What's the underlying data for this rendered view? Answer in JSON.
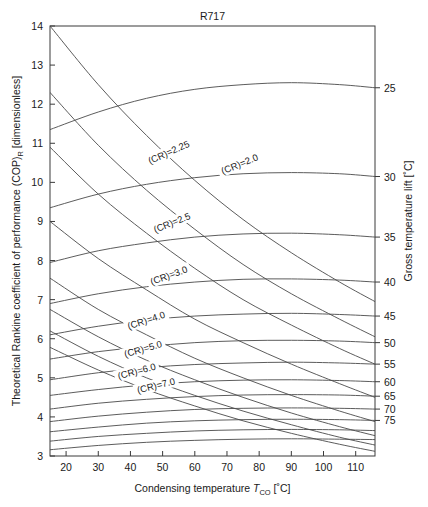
{
  "chart_data": {
    "type": "line",
    "title": "R717",
    "xlabel": "Condensing temperature T_CO [°C]",
    "ylabel": "Theoretical Rankine coefficient of performance (COP)_R [dimensionless]",
    "y2label": "Gross temperature lift [°C]",
    "xlim": [
      15,
      116
    ],
    "ylim": [
      3,
      14
    ],
    "xticks": [
      20,
      30,
      40,
      50,
      60,
      70,
      80,
      90,
      100,
      110
    ],
    "yticks": [
      3,
      4,
      5,
      6,
      7,
      8,
      9,
      10,
      11,
      12,
      13,
      14
    ],
    "y2_ticks": [
      25,
      30,
      35,
      40,
      45,
      50,
      55,
      60,
      65,
      70,
      75
    ],
    "grid": false,
    "legend": "inline curve labels",
    "series": [
      {
        "name": "(CR)=2.0",
        "family": "compression-ratio",
        "label": "(CR)=2.0",
        "label_x": 74,
        "label_y": 10.45,
        "label_rot": -22,
        "x": [
          15,
          30,
          45,
          60,
          75,
          90,
          105,
          116
        ],
        "y": [
          14.0,
          12.5,
          11.2,
          10.05,
          9.05,
          8.2,
          7.45,
          6.95
        ]
      },
      {
        "name": "(CR)=2.25",
        "family": "compression-ratio",
        "label": "(CR)=2.25",
        "label_x": 52,
        "label_y": 10.75,
        "label_rot": -24,
        "x": [
          15,
          30,
          45,
          60,
          75,
          90,
          105,
          116
        ],
        "y": [
          12.3,
          10.95,
          9.8,
          8.8,
          7.9,
          7.15,
          6.5,
          6.05
        ]
      },
      {
        "name": "(CR)=2.5",
        "family": "compression-ratio",
        "label": "(CR)=2.5",
        "label_x": 53,
        "label_y": 8.95,
        "label_rot": -22,
        "x": [
          15,
          30,
          45,
          60,
          75,
          90,
          105,
          116
        ],
        "y": [
          10.9,
          9.7,
          8.7,
          7.8,
          7.0,
          6.35,
          5.75,
          5.35
        ]
      },
      {
        "name": "(CR)=3.0",
        "family": "compression-ratio",
        "label": "(CR)=3.0",
        "label_x": 52,
        "label_y": 7.6,
        "label_rot": -20,
        "x": [
          15,
          30,
          45,
          60,
          75,
          90,
          105,
          116
        ],
        "y": [
          9.0,
          8.05,
          7.25,
          6.5,
          5.9,
          5.35,
          4.85,
          4.5
        ]
      },
      {
        "name": "(CR)=4.0",
        "family": "compression-ratio",
        "label": "(CR)=4.0",
        "label_x": 45,
        "label_y": 6.45,
        "label_rot": -18,
        "x": [
          15,
          30,
          45,
          60,
          75,
          90,
          105,
          116
        ],
        "y": [
          7.55,
          6.75,
          6.1,
          5.5,
          5.0,
          4.55,
          4.15,
          3.88
        ]
      },
      {
        "name": "(CR)=5.0",
        "family": "compression-ratio",
        "label": "(CR)=5.0",
        "label_x": 44,
        "label_y": 5.72,
        "label_rot": -16,
        "x": [
          15,
          30,
          45,
          60,
          75,
          90,
          105,
          116
        ],
        "y": [
          6.75,
          6.05,
          5.45,
          4.95,
          4.5,
          4.1,
          3.75,
          3.52
        ]
      },
      {
        "name": "(CR)=6.0",
        "family": "compression-ratio",
        "label": "(CR)=6.0",
        "label_x": 42,
        "label_y": 5.15,
        "label_rot": -15,
        "x": [
          15,
          30,
          45,
          60,
          75,
          90,
          105,
          116
        ],
        "y": [
          6.2,
          5.55,
          5.0,
          4.55,
          4.15,
          3.8,
          3.48,
          3.28
        ]
      },
      {
        "name": "(CR)=7.0",
        "family": "compression-ratio",
        "label": "(CR)=7.0",
        "label_x": 48,
        "label_y": 4.78,
        "label_rot": -14,
        "x": [
          15,
          30,
          45,
          60,
          75,
          90,
          105,
          116
        ],
        "y": [
          5.78,
          5.2,
          4.7,
          4.28,
          3.9,
          3.58,
          3.3,
          3.12
        ]
      },
      {
        "name": "lift-25",
        "family": "gross-temperature-lift",
        "label": "25",
        "x": [
          15,
          30,
          45,
          60,
          75,
          90,
          105,
          116
        ],
        "y": [
          11.35,
          11.8,
          12.15,
          12.38,
          12.5,
          12.55,
          12.5,
          12.42
        ]
      },
      {
        "name": "lift-30",
        "family": "gross-temperature-lift",
        "label": "30",
        "x": [
          15,
          30,
          45,
          60,
          75,
          90,
          105,
          116
        ],
        "y": [
          9.35,
          9.7,
          9.95,
          10.12,
          10.22,
          10.25,
          10.22,
          10.15
        ]
      },
      {
        "name": "lift-35",
        "family": "gross-temperature-lift",
        "label": "35",
        "x": [
          15,
          30,
          45,
          60,
          75,
          90,
          105,
          116
        ],
        "y": [
          7.95,
          8.25,
          8.45,
          8.6,
          8.68,
          8.7,
          8.66,
          8.6
        ]
      },
      {
        "name": "lift-40",
        "family": "gross-temperature-lift",
        "label": "40",
        "x": [
          15,
          30,
          45,
          60,
          75,
          90,
          105,
          116
        ],
        "y": [
          6.9,
          7.15,
          7.33,
          7.45,
          7.52,
          7.53,
          7.5,
          7.45
        ]
      },
      {
        "name": "lift-45",
        "family": "gross-temperature-lift",
        "label": "45",
        "x": [
          15,
          30,
          45,
          60,
          75,
          90,
          105,
          116
        ],
        "y": [
          6.1,
          6.32,
          6.48,
          6.58,
          6.63,
          6.65,
          6.62,
          6.58
        ]
      },
      {
        "name": "lift-50",
        "family": "gross-temperature-lift",
        "label": "50",
        "x": [
          15,
          30,
          45,
          60,
          75,
          90,
          105,
          116
        ],
        "y": [
          5.48,
          5.67,
          5.8,
          5.9,
          5.95,
          5.96,
          5.94,
          5.9
        ]
      },
      {
        "name": "lift-55",
        "family": "gross-temperature-lift",
        "label": "55",
        "x": [
          15,
          30,
          45,
          60,
          75,
          90,
          105,
          116
        ],
        "y": [
          4.95,
          5.13,
          5.26,
          5.34,
          5.38,
          5.4,
          5.38,
          5.35
        ]
      },
      {
        "name": "lift-60",
        "family": "gross-temperature-lift",
        "label": "60",
        "x": [
          15,
          30,
          45,
          60,
          75,
          90,
          105,
          116
        ],
        "y": [
          4.55,
          4.7,
          4.82,
          4.9,
          4.94,
          4.95,
          4.93,
          4.9
        ]
      },
      {
        "name": "lift-65",
        "family": "gross-temperature-lift",
        "label": "65",
        "x": [
          15,
          30,
          45,
          60,
          75,
          90,
          105,
          116
        ],
        "y": [
          4.2,
          4.35,
          4.45,
          4.52,
          4.56,
          4.57,
          4.56,
          4.53
        ]
      },
      {
        "name": "lift-70",
        "family": "gross-temperature-lift",
        "label": "70",
        "x": [
          15,
          30,
          45,
          60,
          75,
          90,
          105,
          116
        ],
        "y": [
          3.88,
          4.02,
          4.12,
          4.19,
          4.22,
          4.23,
          4.22,
          4.2
        ]
      },
      {
        "name": "lift-75",
        "family": "gross-temperature-lift",
        "label": "75",
        "x": [
          15,
          30,
          45,
          60,
          75,
          90,
          105,
          116
        ],
        "y": [
          3.62,
          3.74,
          3.84,
          3.9,
          3.93,
          3.94,
          3.93,
          3.91
        ]
      },
      {
        "name": "lift-80",
        "family": "gross-temperature-lift",
        "label": "",
        "x": [
          15,
          30,
          45,
          60,
          75,
          90,
          105,
          116
        ],
        "y": [
          3.38,
          3.5,
          3.58,
          3.64,
          3.67,
          3.68,
          3.67,
          3.65
        ]
      },
      {
        "name": "lift-85",
        "family": "gross-temperature-lift",
        "label": "",
        "x": [
          15,
          30,
          45,
          60,
          75,
          90,
          105,
          116
        ],
        "y": [
          3.16,
          3.27,
          3.35,
          3.4,
          3.43,
          3.44,
          3.43,
          3.42
        ]
      }
    ]
  },
  "axes": {
    "x_label_main": "Condensing temperature",
    "x_label_symbol": "T",
    "x_label_symbol_sub": "CO",
    "x_label_unit": "[˚C]",
    "y_label_main": "Theoretical Rankine coefficient of performance (COP)",
    "y_label_sub": "R",
    "y_label_unit": " [dimensionless]",
    "y2_label": "Gross temperature lift [˚C]"
  }
}
